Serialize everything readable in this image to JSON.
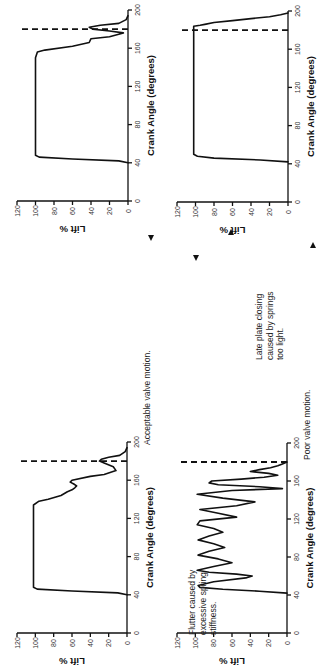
{
  "figure": {
    "orientation": "rotated 90 degrees counter-clockwise",
    "annotations": [
      {
        "id": "acceptable",
        "lines": [
          "Acceptable valve motion."
        ],
        "arrow": "down"
      },
      {
        "id": "flutter",
        "lines": [
          "Flutter caused by",
          "excessive spring",
          "stiffness."
        ],
        "arrow": "down"
      },
      {
        "id": "late",
        "lines": [
          "Late plate closing",
          "caused by springs",
          "too light."
        ],
        "arrow": "up"
      },
      {
        "id": "poor",
        "lines": [
          "Poor valve motion."
        ],
        "arrow": "up"
      }
    ]
  },
  "chart_data": [
    {
      "type": "line",
      "panel": "acceptable-valve-motion-1",
      "title": "",
      "xlabel": "Crank Angle (degrees)",
      "ylabel": "Lift %",
      "xticks": [
        0,
        40,
        80,
        120,
        160,
        200
      ],
      "yticks": [
        0,
        20,
        40,
        60,
        80,
        100,
        120
      ],
      "xlim": [
        0,
        200
      ],
      "ylim": [
        0,
        120
      ],
      "reference_line": {
        "x": 180,
        "style": "dashed"
      },
      "x": [
        40,
        42,
        44,
        46,
        48,
        60,
        100,
        150,
        156,
        158,
        162,
        166,
        170,
        172,
        176,
        178,
        180,
        182,
        184,
        186,
        190,
        194
      ],
      "y": [
        0,
        10,
        60,
        96,
        100,
        100,
        100,
        100,
        98,
        90,
        60,
        42,
        40,
        20,
        5,
        20,
        38,
        42,
        30,
        10,
        2,
        0
      ]
    },
    {
      "type": "line",
      "panel": "poor-valve-motion-late-closing",
      "title": "",
      "xlabel": "Crank Angle (degrees)",
      "ylabel": "Lift %",
      "xticks": [
        0,
        40,
        80,
        120,
        160,
        200
      ],
      "yticks": [
        0,
        20,
        40,
        60,
        80,
        100,
        120
      ],
      "xlim": [
        0,
        200
      ],
      "ylim": [
        0,
        120
      ],
      "reference_line": {
        "x": 180,
        "style": "dashed"
      },
      "x": [
        42,
        44,
        46,
        48,
        50,
        100,
        150,
        184,
        185,
        186,
        188,
        190,
        192,
        194,
        196,
        198
      ],
      "y": [
        0,
        30,
        80,
        98,
        102,
        102,
        102,
        102,
        95,
        90,
        80,
        60,
        40,
        20,
        8,
        0
      ]
    },
    {
      "type": "line",
      "panel": "acceptable-valve-motion-2",
      "title": "",
      "xlabel": "Crank Angle (degrees)",
      "ylabel": "Lift %",
      "xticks": [
        0,
        40,
        80,
        120,
        160,
        200
      ],
      "yticks": [
        0,
        20,
        40,
        60,
        80,
        100,
        120
      ],
      "xlim": [
        0,
        200
      ],
      "ylim": [
        0,
        120
      ],
      "reference_line": {
        "x": 180,
        "style": "dashed"
      },
      "x": [
        40,
        42,
        44,
        46,
        48,
        60,
        100,
        134,
        138,
        140,
        144,
        148,
        150,
        152,
        154,
        156,
        158,
        160,
        164,
        166,
        170,
        174,
        178,
        180,
        182,
        184,
        186,
        190,
        194
      ],
      "y": [
        0,
        10,
        60,
        98,
        102,
        102,
        102,
        102,
        96,
        86,
        72,
        65,
        60,
        57,
        55,
        58,
        62,
        60,
        40,
        25,
        12,
        15,
        25,
        30,
        28,
        20,
        8,
        2,
        0
      ]
    },
    {
      "type": "line",
      "panel": "flutter-excessive-spring-stiffness",
      "title": "",
      "xlabel": "Crank Angle (degrees)",
      "ylabel": "Lift %",
      "xticks": [
        0,
        40,
        80,
        120,
        160,
        200
      ],
      "yticks": [
        0,
        20,
        40,
        60,
        80,
        100,
        120
      ],
      "xlim": [
        0,
        200
      ],
      "ylim": [
        0,
        120
      ],
      "reference_line": {
        "x": 180,
        "style": "dashed"
      },
      "x": [
        42,
        44,
        46,
        48,
        50,
        54,
        58,
        60,
        62,
        64,
        66,
        70,
        74,
        78,
        82,
        86,
        90,
        94,
        98,
        102,
        106,
        110,
        114,
        118,
        122,
        126,
        130,
        134,
        138,
        142,
        146,
        150,
        152,
        154,
        156,
        158,
        160,
        162,
        164,
        166,
        168,
        170,
        172,
        174,
        176,
        178,
        180
      ],
      "y": [
        0,
        30,
        70,
        95,
        97,
        80,
        45,
        38,
        55,
        85,
        98,
        80,
        60,
        75,
        97,
        85,
        68,
        80,
        97,
        85,
        70,
        80,
        98,
        95,
        55,
        75,
        95,
        55,
        35,
        70,
        98,
        60,
        5,
        30,
        75,
        85,
        82,
        50,
        25,
        10,
        20,
        40,
        30,
        18,
        10,
        5,
        0
      ]
    }
  ]
}
